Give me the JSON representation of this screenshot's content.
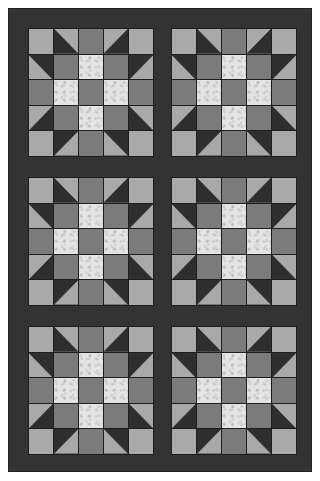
{
  "quilt": {
    "name": "Sawtooth Star sampler quilt",
    "rows": 3,
    "cols": 2,
    "block_count": 6,
    "block_grid": 5,
    "colors": {
      "border": "#333333",
      "sashing": "#333333",
      "seam": "#1e1e1e",
      "dark": "#2e2e2e",
      "light": "#a9a9a9",
      "medium": "#7b7b7b",
      "print": "#e4e4e4"
    },
    "block_pattern": [
      [
        "light",
        "hst:dark-bl",
        "medium",
        "hst:dark-br",
        "light"
      ],
      [
        "hst:dark-tr",
        "medium",
        "print",
        "medium",
        "hst:dark-tl"
      ],
      [
        "medium",
        "print",
        "medium",
        "print",
        "medium"
      ],
      [
        "hst:dark-br",
        "medium",
        "print",
        "medium",
        "hst:dark-bl"
      ],
      [
        "light",
        "hst:dark-tl",
        "medium",
        "hst:dark-tr",
        "light"
      ]
    ],
    "blocks": [
      {
        "row": 0,
        "col": 0,
        "x": 27,
        "y": 27
      },
      {
        "row": 0,
        "col": 1,
        "x": 170,
        "y": 27
      },
      {
        "row": 1,
        "col": 0,
        "x": 27,
        "y": 176
      },
      {
        "row": 1,
        "col": 1,
        "x": 170,
        "y": 176
      },
      {
        "row": 2,
        "col": 0,
        "x": 27,
        "y": 325
      },
      {
        "row": 2,
        "col": 1,
        "x": 170,
        "y": 325
      }
    ]
  }
}
